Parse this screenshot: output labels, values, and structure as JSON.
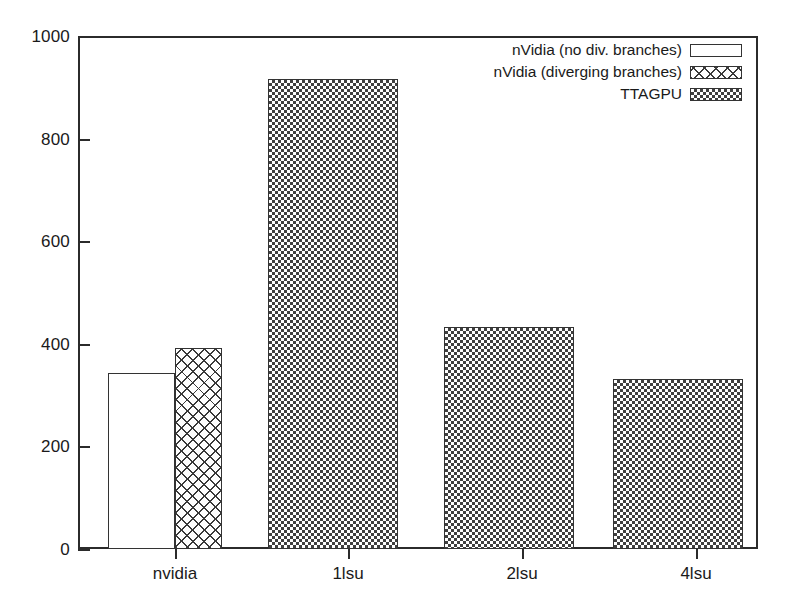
{
  "chart_data": {
    "type": "bar",
    "title": "",
    "xlabel": "",
    "ylabel": "",
    "ylim": [
      0,
      1000
    ],
    "ytick_values": [
      0,
      200,
      400,
      600,
      800,
      1000
    ],
    "ytick_labels": [
      "0",
      "200",
      "400",
      "600",
      "800",
      "1000"
    ],
    "grid": false,
    "legend_position": "top-right",
    "categories": [
      "nvidia",
      "1lsu",
      "2lsu",
      "4lsu"
    ],
    "series": [
      {
        "name": "nVidia (no div. branches)",
        "fill": "empty",
        "values": [
          343,
          null,
          null,
          null
        ]
      },
      {
        "name": "nVidia (diverging branches)",
        "fill": "crosshatch",
        "values": [
          392,
          null,
          null,
          null
        ]
      },
      {
        "name": "TTAGPU",
        "fill": "checker",
        "values": [
          null,
          916,
          433,
          331
        ]
      }
    ],
    "bars": [
      {
        "category": "nvidia",
        "series": "nVidia (no div. branches)",
        "value": 343,
        "fill": "empty",
        "x": 108,
        "width": 67
      },
      {
        "category": "nvidia",
        "series": "nVidia (diverging branches)",
        "value": 392,
        "fill": "crosshatch",
        "x": 175,
        "width": 47
      },
      {
        "category": "1lsu",
        "series": "TTAGPU",
        "value": 916,
        "fill": "checker",
        "x": 268,
        "width": 130
      },
      {
        "category": "2lsu",
        "series": "TTAGPU",
        "value": 433,
        "fill": "checker",
        "x": 444,
        "width": 130
      },
      {
        "category": "4lsu",
        "series": "TTAGPU",
        "value": 331,
        "fill": "checker",
        "x": 613,
        "width": 130
      }
    ],
    "xtick_positions": [
      175,
      348,
      522,
      696
    ]
  },
  "legend": {
    "entries": [
      {
        "label": "nVidia (no div. branches)",
        "fill": "empty"
      },
      {
        "label": "nVidia (diverging branches)",
        "fill": "crosshatch"
      },
      {
        "label": "TTAGPU",
        "fill": "checker"
      }
    ]
  },
  "colors": {
    "axis": "#2b2b2b",
    "bar_outline": "#333333",
    "background": "#ffffff",
    "pattern_ink": "#3f3f3f"
  }
}
